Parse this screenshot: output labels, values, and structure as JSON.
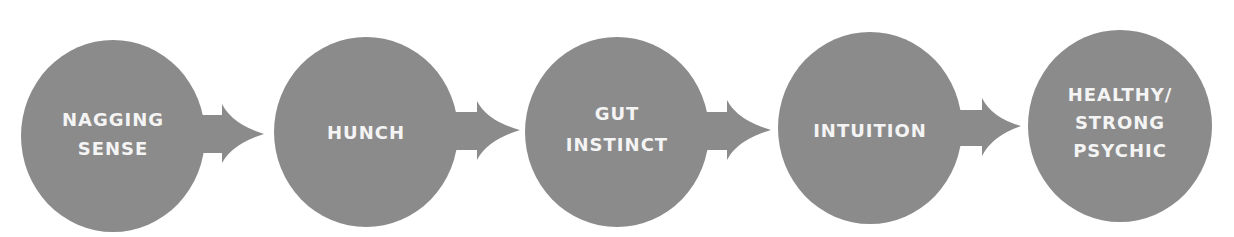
{
  "diagram": {
    "type": "flow-sequence",
    "colors": {
      "shape_fill": "#8b8b8b",
      "label_text": "#f4f4f4",
      "background": "#ffffff"
    },
    "stages": [
      {
        "lines": [
          "NAGGING",
          "SENSE"
        ]
      },
      {
        "lines": [
          "HUNCH"
        ]
      },
      {
        "lines": [
          "GUT",
          "INSTINCT"
        ]
      },
      {
        "lines": [
          "INTUITION"
        ]
      },
      {
        "lines": [
          "HEALTHY/",
          "STRONG",
          "PSYCHIC"
        ]
      }
    ],
    "arrows": [
      {
        "from": 0,
        "to": 1
      },
      {
        "from": 1,
        "to": 2
      },
      {
        "from": 2,
        "to": 3
      },
      {
        "from": 3,
        "to": 4
      }
    ]
  }
}
